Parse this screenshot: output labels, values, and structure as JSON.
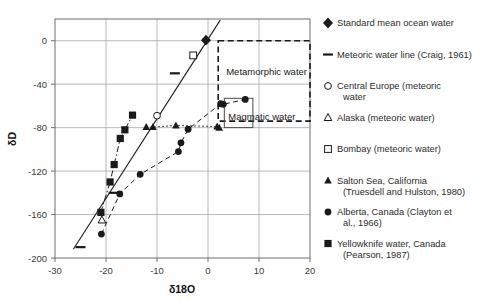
{
  "chart_data": {
    "type": "scatter",
    "title": "",
    "xlabel": "δ18O",
    "ylabel": "δD",
    "xlim": [
      -30,
      20
    ],
    "ylim": [
      -200,
      20
    ],
    "xticks": [
      -30,
      -20,
      -10,
      0,
      10,
      20
    ],
    "yticks": [
      0,
      -40,
      -80,
      -120,
      -160,
      -200
    ],
    "xtick_labels": [
      "-30",
      "-20",
      "-10",
      "0",
      "10",
      "20"
    ],
    "ytick_labels": [
      "0",
      "-40",
      "-80",
      "-120",
      "-160",
      "-200"
    ],
    "grid": true,
    "legend_position": "right",
    "series": [
      {
        "name": "Standard mean ocean water",
        "marker": "filled-diamond",
        "points": [
          [
            -0.4,
            0.5
          ]
        ]
      },
      {
        "name": "Meteoric water line (Craig, 1961)",
        "marker": "line-dash",
        "type": "line",
        "points": [
          [
            -26.4,
            -192.0
          ],
          [
            2.4,
            19.0
          ]
        ],
        "dash_markers": [
          [
            -25.0,
            -190.0
          ],
          [
            -18.5,
            -140.0
          ],
          [
            -6.5,
            -30.0
          ]
        ]
      },
      {
        "name": "Central Europe (meteoric water",
        "marker": "open-circle",
        "points": [
          [
            -10.0,
            -69.0
          ]
        ]
      },
      {
        "name": "Alaska (meteoric water)",
        "marker": "open-triangle",
        "points": [
          [
            -20.8,
            -165.0
          ]
        ]
      },
      {
        "name": "Bombay (meteoric water)",
        "marker": "open-square",
        "points": [
          [
            -2.9,
            -13.5
          ]
        ]
      },
      {
        "name": "Salton Sea, California (Truesdell and Hulston, 1980)",
        "marker": "filled-triangle",
        "type": "scatter-dotted",
        "points": [
          [
            -12.1,
            -79.5
          ],
          [
            -10.8,
            -79.5
          ],
          [
            -6.3,
            -78.0
          ],
          [
            1.8,
            -79.0
          ],
          [
            2.2,
            -80.0
          ]
        ]
      },
      {
        "name": "Alberta, Canada (Clayton et al., 1966)",
        "marker": "filled-circle",
        "type": "scatter-dashed",
        "points": [
          [
            -20.9,
            -178.0
          ],
          [
            -17.3,
            -141.0
          ],
          [
            -13.3,
            -123.0
          ],
          [
            -5.8,
            -102.0
          ],
          [
            -5.3,
            -94.0
          ],
          [
            -3.9,
            -81.5
          ],
          [
            2.5,
            -58.0
          ],
          [
            3.0,
            -58.5
          ],
          [
            7.3,
            -54.0
          ]
        ]
      },
      {
        "name": "Yellowknife water, Canada (Pearson, 1987)",
        "marker": "filled-square",
        "type": "scatter-dashdot",
        "points": [
          [
            -21.0,
            -158.0
          ],
          [
            -19.2,
            -130.0
          ],
          [
            -18.4,
            -114.0
          ],
          [
            -17.2,
            -90.0
          ],
          [
            -16.3,
            -82.0
          ],
          [
            -14.8,
            -68.5
          ]
        ]
      }
    ],
    "annotations": [
      {
        "label": "Metamorphic water",
        "shape": "dashed-rect",
        "x0": 2.0,
        "x1": 20.0,
        "y0": -74.0,
        "y1": 0.0
      },
      {
        "label": "Magmatic water",
        "shape": "solid-rect",
        "x0": 3.2,
        "x1": 8.8,
        "y0": -80.0,
        "y1": -53.0
      }
    ]
  },
  "legend": {
    "entries": [
      {
        "marker": "filled-diamond",
        "label": "Standard mean ocean water",
        "label2": ""
      },
      {
        "marker": "dash",
        "label": "Meteoric water line (Craig, 1961)",
        "label2": ""
      },
      {
        "marker": "open-circle",
        "label": "Central Europe (meteoric",
        "label2": "water"
      },
      {
        "marker": "open-triangle",
        "label": "Alaska (meteoric water)",
        "label2": ""
      },
      {
        "marker": "open-square",
        "label": "Bombay (meteoric water)",
        "label2": ""
      },
      {
        "marker": "filled-triangle",
        "label": "Salton Sea, California",
        "label2": "(Truesdell and Hulston, 1980)"
      },
      {
        "marker": "filled-circle",
        "label": "Alberta, Canada (Clayton et",
        "label2": "al., 1966)"
      },
      {
        "marker": "filled-square",
        "label": "Yellowknife water, Canada",
        "label2": "(Pearson, 1987)"
      }
    ]
  },
  "colors": {
    "ink": "#1a1a1a",
    "grid": "#a8a8a8",
    "frame": "#6e6e6e",
    "text": "#2b2b2b"
  }
}
